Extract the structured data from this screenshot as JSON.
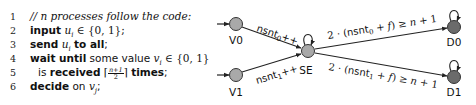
{
  "code": {
    "lines": [
      {
        "num": "1",
        "comment": "// n processes follow the code:"
      },
      {
        "num": "2",
        "kw1": "input",
        "var": "u",
        "sub": "i",
        "rest": " ∈ {0, 1};"
      },
      {
        "num": "3",
        "kw1": "send",
        "var": "u",
        "sub": "i",
        "kw2": "to all",
        "end": ";"
      },
      {
        "num": "4",
        "kw1": "wait until",
        "text": " some value ",
        "var": "v",
        "sub": "i",
        "rest": " ∈ {0, 1}"
      },
      {
        "num": "5",
        "text": "is ",
        "kw1": "received",
        "ceil_open": "⌈",
        "frac_num": "n+1",
        "frac_den": "2",
        "ceil_close": "⌉",
        "kw2": "times",
        "end": ";"
      },
      {
        "num": "6",
        "kw1": "decide",
        "text": " on ",
        "var": "v",
        "sub": "j",
        "end": ";"
      }
    ]
  },
  "diagram": {
    "nodes": [
      {
        "id": "V0",
        "label": "V0",
        "fill": "#a9a9a9"
      },
      {
        "id": "V1",
        "label": "V1",
        "fill": "#a9a9a9"
      },
      {
        "id": "SE",
        "label": "SE",
        "fill": "#a9a9a9"
      },
      {
        "id": "D0",
        "label": "D0",
        "fill": "#6b6b6b"
      },
      {
        "id": "D1",
        "label": "D1",
        "fill": "#6b6b6b"
      }
    ],
    "edges": [
      {
        "from": "V0",
        "to": "SE",
        "label_base": "nsnt",
        "label_sub": "0",
        "label_suffix": "++"
      },
      {
        "from": "V1",
        "to": "SE",
        "label_base": "nsnt",
        "label_sub": "1",
        "label_suffix": "++"
      },
      {
        "from": "SE",
        "to": "D0",
        "label_prefix": "2 · (",
        "label_base": "nsnt",
        "label_sub": "0",
        "label_mid": " + ",
        "label_f": "f",
        "label_close": ") ≥ ",
        "label_n": "n",
        "label_end": " + 1"
      },
      {
        "from": "SE",
        "to": "D1",
        "label_prefix": "2 · (",
        "label_base": "nsnt",
        "label_sub": "1",
        "label_mid": " + ",
        "label_f": "f",
        "label_close": ") ≥ ",
        "label_n": "n",
        "label_end": " + 1"
      },
      {
        "from": "SE",
        "to": "SE",
        "type": "self-loop"
      },
      {
        "from": "D0",
        "to": "D0",
        "type": "self-loop"
      },
      {
        "from": "D1",
        "to": "D1",
        "type": "self-loop"
      }
    ],
    "initial_nodes": [
      "V0",
      "V1"
    ]
  }
}
